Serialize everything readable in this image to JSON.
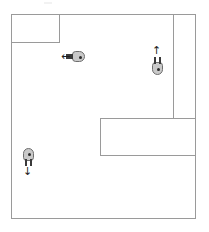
{
  "scene": {
    "type": "top-down-occupancy-map",
    "background_color": "#ffffff",
    "wall_color": "#9a9a9a",
    "robot_body_color": "#c9c9c9",
    "robot_outline_color": "#6e6e6e",
    "robot_marker_color": "#2b2b2b",
    "arrow_color": "#1f1f1f"
  },
  "arena": {
    "label": "arena-boundary",
    "x": 11,
    "y": 14,
    "width": 185,
    "height": 205
  },
  "obstacles": [
    {
      "name": "top-left-block",
      "label": "Obstacle",
      "x": 11,
      "y": 14,
      "width": 49,
      "height": 29
    },
    {
      "name": "bottom-right-block",
      "label": "Obstacle",
      "x": 100,
      "y": 118,
      "width": 96,
      "height": 38
    }
  ],
  "walls": [
    {
      "name": "right-vertical-wall",
      "orientation": "vertical",
      "x": 173,
      "y": 14,
      "length": 105
    }
  ],
  "robots": [
    {
      "id": "robot-1",
      "name": "robot-left-facing",
      "heading": "left",
      "arrow_glyph": "←",
      "x": 72,
      "y": 51,
      "width": 13,
      "height": 11,
      "arrow_x": 61,
      "arrow_y": 51
    },
    {
      "id": "robot-2",
      "name": "robot-up-facing",
      "heading": "up",
      "arrow_glyph": "↑",
      "x": 152,
      "y": 62,
      "width": 11,
      "height": 13,
      "arrow_x": 152,
      "arrow_y": 45
    },
    {
      "id": "robot-3",
      "name": "robot-down-facing",
      "heading": "down",
      "arrow_glyph": "↓",
      "x": 23,
      "y": 148,
      "width": 11,
      "height": 13,
      "arrow_x": 23,
      "arrow_y": 166
    }
  ],
  "artifacts": [
    {
      "name": "top-smudge",
      "x": 44,
      "y": 2,
      "width": 8,
      "height": 2
    }
  ]
}
